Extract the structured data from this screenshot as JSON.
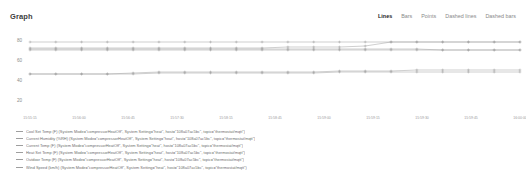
{
  "panel": {
    "title": "Graph"
  },
  "toolbar": {
    "items": [
      {
        "label": "Lines",
        "active": true
      },
      {
        "label": "Bars",
        "active": false
      },
      {
        "label": "Points",
        "active": false
      },
      {
        "label": "Dashed lines",
        "active": false
      },
      {
        "label": "Dashed bars",
        "active": false
      }
    ]
  },
  "legend": {
    "items": [
      {
        "label": "Cool Set Temp (F) (System Mode=\"compressorHeatOff\", System Setting=\"heat\", host=\"108a07ac5bc\", topic=\"thermostat/mqtt\")",
        "color": "#9e9e9e"
      },
      {
        "label": "Current Humidity (%RH) (System Mode=\"compressorHeatOff\", System Setting=\"heat\", host=\"108a07ac5bc\", topic=\"thermostat/mqtt\")",
        "color": "#9e9e9e"
      },
      {
        "label": "Current Temp (F) (System Mode=\"compressorHeatOff\", System Setting=\"heat\", host=\"108a07ac5bc\", topic=\"thermostat/mqtt\")",
        "color": "#9e9e9e"
      },
      {
        "label": "Heat Set Temp (F) (System Mode=\"compressorHeatOff\", System Setting=\"heat\", host=\"108a07ac5bc\", topic=\"thermostat/mqtt\")",
        "color": "#9e9e9e"
      },
      {
        "label": "Outdoor Temp (F) (System Mode=\"compressorHeatOff\", System Setting=\"heat\", host=\"108a07ac5bc\", topic=\"thermostat/mqtt\")",
        "color": "#9e9e9e"
      },
      {
        "label": "Wind Speed (km/h) (System Mode=\"compressorHeatOff\", System Setting=\"heat\", host=\"108a07ac5bc\", topic=\"thermostat/mqtt\")",
        "color": "#9e9e9e"
      }
    ]
  },
  "chart_data": {
    "type": "line",
    "title": "Graph",
    "xlabel": "",
    "ylabel": "",
    "ylim": [
      10,
      90
    ],
    "yticks": [
      80,
      60,
      40,
      20
    ],
    "grid": false,
    "legend_position": "bottom",
    "x": [
      "15:55:15",
      "15:55:30",
      "15:55:45",
      "15:56:00",
      "15:56:15",
      "15:56:30",
      "15:56:45",
      "15:57:00",
      "15:57:15",
      "15:57:30",
      "15:57:45",
      "15:58:00",
      "15:58:15",
      "15:58:30",
      "15:58:45",
      "15:59:00",
      "15:59:15",
      "15:59:30",
      "15:59:45",
      "16:00:00"
    ],
    "xtick_labels": [
      "15:55:15",
      "15:56:00",
      "15:56:45",
      "15:57:30",
      "15:58:15",
      "15:58:45",
      "15:59:00",
      "15:59:15",
      "15:59:30",
      "15:59:45",
      "16:00:00"
    ],
    "series": [
      {
        "name": "Cool Set Temp (F)",
        "color": "#9e9e9e",
        "values": [
          78,
          78,
          78,
          78,
          78,
          78,
          78,
          78,
          78,
          78,
          78,
          78,
          78,
          78,
          78,
          78,
          78,
          78,
          78,
          78
        ]
      },
      {
        "name": "Current Humidity (%RH)",
        "color": "#9e9e9e",
        "values": [
          72,
          72,
          72,
          72,
          72,
          72,
          72,
          72,
          72,
          72,
          73,
          73,
          73,
          74,
          78,
          78,
          78,
          78,
          78,
          78
        ]
      },
      {
        "name": "Current Temp (F)",
        "color": "#9e9e9e",
        "values": [
          71,
          71,
          71,
          71,
          71,
          71,
          71,
          71,
          71,
          71,
          71,
          71,
          71,
          71,
          71,
          71,
          70,
          70,
          70,
          70
        ]
      },
      {
        "name": "Heat Set Temp (F)",
        "color": "#9e9e9e",
        "values": [
          70,
          70,
          70,
          70,
          70,
          70,
          70,
          70,
          70,
          70,
          70,
          70,
          70,
          70,
          70,
          70,
          70,
          70,
          70,
          70
        ]
      },
      {
        "name": "Outdoor Temp (F)",
        "color": "#9e9e9e",
        "values": [
          46,
          46,
          46,
          46,
          47,
          48,
          48,
          48,
          48,
          48,
          48,
          48,
          49,
          49,
          49,
          50,
          50,
          50,
          50,
          50
        ]
      },
      {
        "name": "Wind Speed (km/h)",
        "color": "#9e9e9e",
        "values": [
          46,
          46,
          46,
          46,
          46,
          47,
          47,
          47,
          47,
          47,
          47,
          47,
          48,
          48,
          48,
          48,
          48,
          48,
          48,
          48
        ]
      }
    ]
  }
}
